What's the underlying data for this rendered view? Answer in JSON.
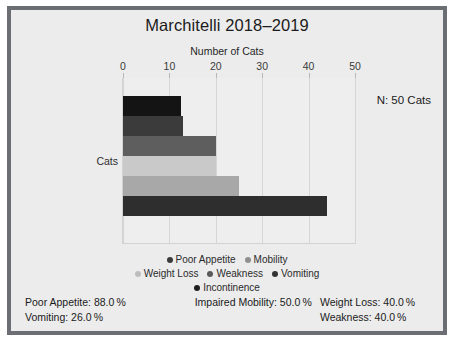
{
  "chart_data": {
    "type": "bar",
    "orientation": "horizontal",
    "title": "Marchitelli 2018–2019",
    "xlabel": "Number of Cats",
    "ylabel": "Cats",
    "xlim": [
      0,
      50
    ],
    "xticks": [
      0,
      10,
      20,
      30,
      40,
      50
    ],
    "xtick_labels": [
      "0",
      "10",
      "20",
      "30",
      "40",
      "50"
    ],
    "grid": true,
    "legend_position": "bottom",
    "categories": [
      "Cats"
    ],
    "series": [
      {
        "name": "Poor Appetite",
        "values": [
          12.5
        ],
        "color": "#141414"
      },
      {
        "name": "Mobility",
        "values": [
          13.0
        ],
        "color": "#3b3b3b"
      },
      {
        "name": "Weight Loss",
        "values": [
          20.0
        ],
        "color": "#5e5e5e"
      },
      {
        "name": "Weakness",
        "values": [
          20.0
        ],
        "color": "#c9c9c9"
      },
      {
        "name": "Vomiting",
        "values": [
          25.0
        ],
        "color": "#a8a8a8"
      },
      {
        "name": "Incontinence",
        "values": [
          44.0
        ],
        "color": "#2e2e2e"
      }
    ],
    "annotation": "N: 50 Cats"
  },
  "legend": {
    "rows": [
      [
        {
          "label": "Poor Appetite",
          "color": "#3a3a3a"
        },
        {
          "label": "Mobility",
          "color": "#8f8f8f"
        }
      ],
      [
        {
          "label": "Weight Loss",
          "color": "#bdbdbd"
        },
        {
          "label": "Weakness",
          "color": "#5a5a5a"
        },
        {
          "label": "Vomiting",
          "color": "#333333"
        }
      ],
      [
        {
          "label": "Incontinence",
          "color": "#1f1f1f"
        }
      ]
    ]
  },
  "stats": {
    "row1": [
      "Poor Appetite: 88.0 %",
      "Impaired Mobility: 50.0 %",
      "Weight Loss: 40.0 %"
    ],
    "row2": [
      "Vomiting: 26.0 %",
      "",
      "Weakness: 40.0 %"
    ]
  }
}
